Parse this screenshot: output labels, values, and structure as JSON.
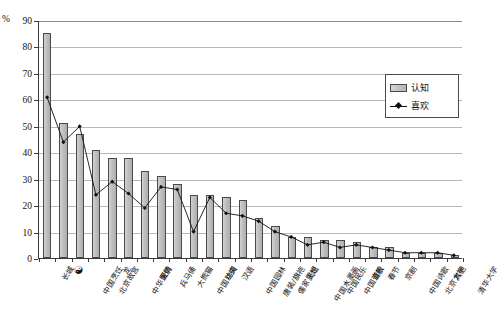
{
  "chart_data": {
    "type": "bar",
    "title": "",
    "subtitle": "",
    "xlabel": "",
    "ylabel": "%",
    "ylim": [
      0,
      90
    ],
    "ytick_step": 10,
    "yticks": [
      0,
      10,
      20,
      30,
      40,
      50,
      60,
      70,
      80,
      90
    ],
    "grid": "horizontal",
    "legend_position": "upper-right-inside",
    "categories": [
      "长城",
      "太极",
      "中国烹饪",
      "北京故宫",
      "龙",
      "中华医药",
      "爱情",
      "兵马俑",
      "大熊猫",
      "中国功夫",
      "丝绸",
      "汉语",
      "中国园林",
      "唐装/旗袍",
      "儒家思想",
      "天坛",
      "中国水墨画",
      "中国民乐",
      "中国音乐",
      "道教",
      "春节",
      "京剧",
      "中国诗歌",
      "北京大学",
      "其他",
      "清华大学"
    ],
    "series": [
      {
        "name": "认知",
        "type": "bar",
        "color": "#bdbdbd",
        "values": [
          85,
          51,
          47,
          41,
          38,
          38,
          33,
          31,
          28,
          24,
          24,
          23,
          22,
          15,
          12,
          8,
          8,
          7,
          7,
          6,
          4,
          4,
          2,
          2,
          2,
          1
        ]
      },
      {
        "name": "喜欢",
        "type": "line",
        "color": "#111111",
        "marker": "diamond",
        "values": [
          61,
          44,
          50,
          24,
          29,
          24.5,
          19,
          27,
          26,
          10,
          23,
          17,
          16,
          14,
          10,
          8,
          5,
          6,
          4,
          5,
          4,
          3,
          2,
          2,
          2,
          1
        ]
      }
    ]
  },
  "axis": {
    "unit_label": "%",
    "y_labels": [
      "90",
      "80",
      "70",
      "60",
      "50",
      "40",
      "30",
      "20",
      "10",
      "0"
    ]
  },
  "legend": {
    "items": [
      {
        "label": "认知",
        "kind": "bar"
      },
      {
        "label": "喜欢",
        "kind": "line"
      }
    ]
  }
}
